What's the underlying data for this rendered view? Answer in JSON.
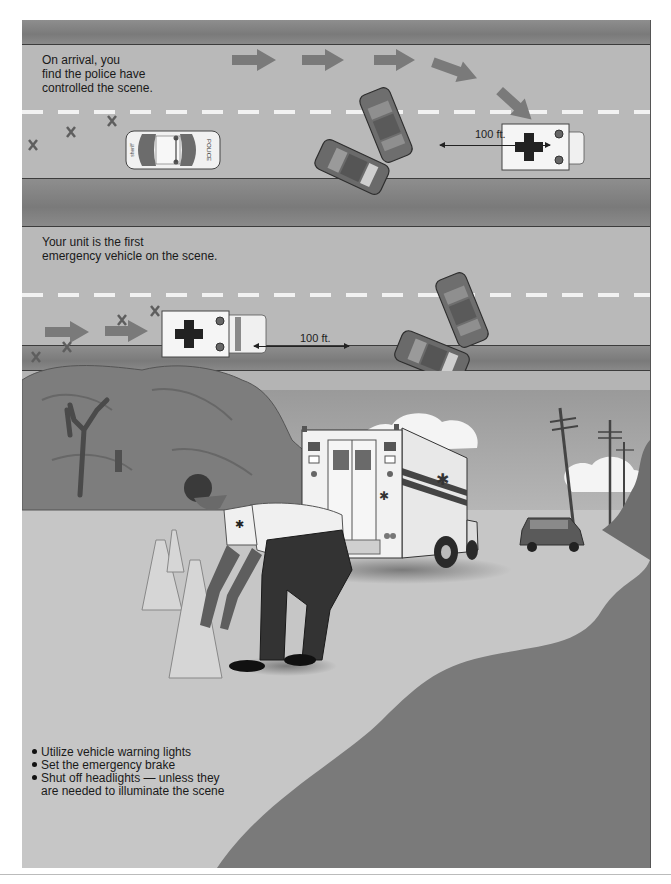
{
  "panel1": {
    "caption": [
      "On arrival, you",
      "find the police have",
      "controlled the scene."
    ],
    "distance_label": "100 ft.",
    "police_car_label": "POLICE"
  },
  "panel2": {
    "caption": [
      "Your unit is the first",
      "emergency vehicle on the scene."
    ],
    "distance_label": "100 ft."
  },
  "scene": {
    "ambulance_text": "EMERGENCY AMBULANCE",
    "ambulance_number": "No. 42",
    "bullets": [
      "Utilize vehicle warning lights",
      "Set the emergency brake",
      "Shut off headlights — unless they are needed to illuminate the scene"
    ]
  },
  "colors": {
    "curb": "#828282",
    "road": "#b9b9b9",
    "ground_dark": "#7a7a7a",
    "ground_light": "#c8c8c8"
  }
}
